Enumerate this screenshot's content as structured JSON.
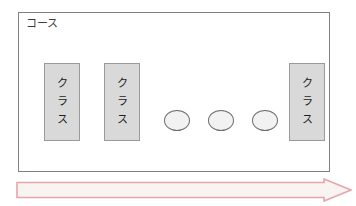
{
  "diagram": {
    "frame": {
      "label": "コース"
    },
    "class_boxes": [
      {
        "name": "class-box-left",
        "chars": [
          "ク",
          "ラ",
          "ス"
        ],
        "text": "クラス"
      },
      {
        "name": "class-box-second",
        "chars": [
          "ク",
          "ラ",
          "ス"
        ],
        "text": "クラス"
      },
      {
        "name": "class-box-right",
        "chars": [
          "ク",
          "ラ",
          "ス"
        ],
        "text": "クラス"
      }
    ],
    "nodes": [
      {
        "name": "node-1",
        "label": ""
      },
      {
        "name": "node-2",
        "label": ""
      },
      {
        "name": "node-3",
        "label": ""
      }
    ],
    "arrow": {
      "name": "direction-arrow",
      "direction": "right",
      "label": ""
    },
    "colors": {
      "frame_border": "#808080",
      "frame_fill": "#ffffff",
      "box_fill": "#d9d9d9",
      "box_border": "#9a9a9a",
      "node_fill": "#f2f2f2",
      "node_border": "#6d6d6d",
      "arrow_fill": "#f7f4f2",
      "arrow_border": "#e8a4ac",
      "text": "#1d1d1d"
    }
  }
}
